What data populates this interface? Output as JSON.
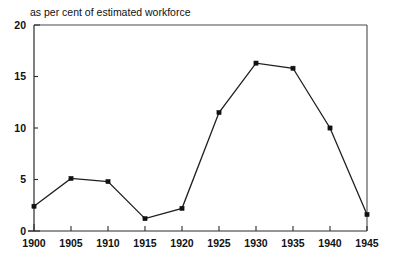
{
  "chart_data": {
    "type": "line",
    "title": "as per cent of estimated workforce",
    "subtitle": "",
    "xlabel": "",
    "ylabel": "",
    "x": [
      1900,
      1905,
      1910,
      1915,
      1920,
      1925,
      1930,
      1935,
      1940,
      1945
    ],
    "values": [
      2.4,
      5.1,
      4.8,
      1.2,
      2.2,
      11.5,
      16.3,
      15.8,
      10.0,
      1.6
    ],
    "series": [
      {
        "name": "unemployment",
        "values": [
          2.4,
          5.1,
          4.8,
          1.2,
          2.2,
          11.5,
          16.3,
          15.8,
          10.0,
          1.6
        ]
      }
    ],
    "xtick_labels": [
      "1900",
      "1905",
      "1910",
      "1915",
      "1920",
      "1925",
      "1930",
      "1935",
      "1940",
      "1945"
    ],
    "ytick_labels": [
      "0",
      "5",
      "10",
      "15",
      "20"
    ],
    "ytick_values": [
      0,
      5,
      10,
      15,
      20
    ],
    "xlim": [
      1900,
      1945
    ],
    "ylim": [
      0,
      20
    ],
    "grid": false,
    "legend": false,
    "legend_position": "none",
    "marker": "square",
    "line_color": "#1f1f1f",
    "marker_color": "#111111",
    "background_color": "#ffffff",
    "axis_color": "#2b2b2b"
  },
  "figure": {
    "title_text": "as per cent of estimated workforce"
  }
}
